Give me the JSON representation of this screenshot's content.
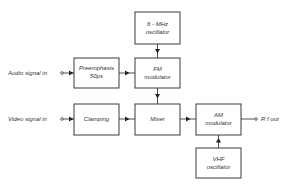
{
  "diagram": {
    "blocks": {
      "osc6": {
        "line1": "6 - MHz",
        "line2": "oscillator"
      },
      "fm": {
        "line1": "FM",
        "line2": "modulator"
      },
      "pre": {
        "line1": "Preemphasis",
        "line2": "50µs"
      },
      "clamp": {
        "line1": "Clamping"
      },
      "mixer": {
        "line1": "Mixer"
      },
      "am": {
        "line1": "AM",
        "line2": "modulator"
      },
      "vhf": {
        "line1": "VHF",
        "line2": "oscillator"
      }
    },
    "inputs": {
      "audio": "Audio signal in",
      "video": "Video signal  in"
    },
    "outputs": {
      "rf": "R f  out"
    },
    "connections": [
      {
        "from": "Audio signal in",
        "to": "Preemphasis"
      },
      {
        "from": "Preemphasis",
        "to": "FM modulator"
      },
      {
        "from": "6-MHz oscillator",
        "to": "FM modulator"
      },
      {
        "from": "FM modulator",
        "to": "Mixer"
      },
      {
        "from": "Video signal in",
        "to": "Clamping"
      },
      {
        "from": "Clamping",
        "to": "Mixer"
      },
      {
        "from": "Mixer",
        "to": "AM modulator"
      },
      {
        "from": "VHF oscillator",
        "to": "AM modulator"
      },
      {
        "from": "AM modulator",
        "to": "R f out"
      }
    ]
  }
}
